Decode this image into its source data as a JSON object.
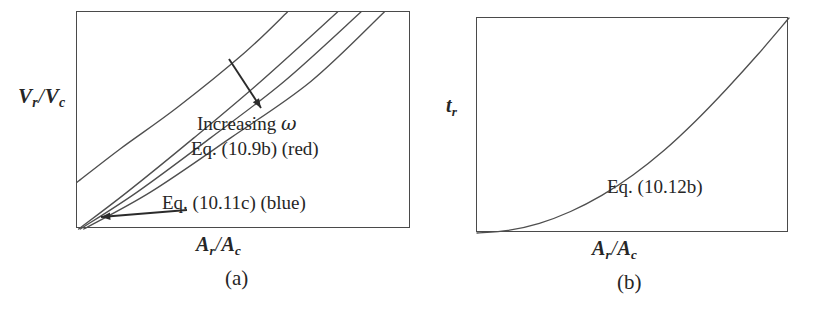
{
  "figure": {
    "background_color": "#ffffff",
    "ink_color": "#2b2b2b",
    "frame_color": "#4a4a4a",
    "curve_color": "#4f4f4f"
  },
  "panel_a": {
    "caption": "(a)",
    "ylabel": {
      "symbol": "V",
      "sub1": "r",
      "slash": "/",
      "symbol2": "V",
      "sub2": "c"
    },
    "xlabel": {
      "symbol": "A",
      "sub1": "r",
      "slash": "/",
      "symbol2": "A",
      "sub2": "c"
    },
    "annotations": {
      "increasing": "Increasing",
      "omega": "ω",
      "eq_red": "Eq. (10.9b)  (red)",
      "eq_blue": "Eq. (10.11c)  (blue)"
    },
    "arrows": {
      "increasing_arrow": "down-right-arrow",
      "blue_arrow": "left-arrow"
    }
  },
  "panel_b": {
    "caption": "(b)",
    "ylabel": {
      "symbol": "t",
      "sub1": "r"
    },
    "xlabel": {
      "symbol": "A",
      "sub1": "r",
      "slash": "/",
      "symbol2": "A",
      "sub2": "c"
    },
    "annotations": {
      "eq_curve": "Eq. (10.12b)"
    }
  },
  "chart_data": [
    {
      "id": "panel-a",
      "type": "line",
      "title": "(a)",
      "xlabel": "A_r/A_c",
      "ylabel": "V_r/V_c",
      "xlim": [
        0,
        1
      ],
      "ylim": [
        0,
        1
      ],
      "grid": false,
      "ticks": false,
      "legend": "in-plot text annotations",
      "annotations": [
        "Increasing ω",
        "Eq. (10.9b)  (red)",
        "Eq. (10.11c)  (blue)"
      ],
      "series": [
        {
          "name": "Eq. (10.11c) (blue)",
          "comment": "leftmost / steepest-looking line, exits left edge",
          "x": [
            0.0,
            0.13,
            0.3,
            0.5,
            0.63
          ],
          "y": [
            0.215,
            0.37,
            0.56,
            0.81,
            1.0
          ]
        },
        {
          "name": "Eq. (10.9b) (red) - low omega",
          "x": [
            0.005,
            0.15,
            0.35,
            0.55,
            0.78
          ],
          "y": [
            0.0,
            0.17,
            0.42,
            0.68,
            1.0
          ]
        },
        {
          "name": "Eq. (10.9b) (red) - mid omega",
          "x": [
            0.01,
            0.18,
            0.4,
            0.62,
            0.85
          ],
          "y": [
            0.0,
            0.17,
            0.42,
            0.68,
            1.0
          ]
        },
        {
          "name": "Eq. (10.9b) (red) - high omega",
          "x": [
            0.02,
            0.22,
            0.46,
            0.7,
            0.92
          ],
          "y": [
            0.0,
            0.17,
            0.42,
            0.68,
            1.0
          ]
        }
      ]
    },
    {
      "id": "panel-b",
      "type": "line",
      "title": "(b)",
      "xlabel": "A_r/A_c",
      "ylabel": "t_r",
      "xlim": [
        0,
        1
      ],
      "ylim": [
        0,
        1
      ],
      "grid": false,
      "ticks": false,
      "annotations": [
        "Eq. (10.12b)"
      ],
      "series": [
        {
          "name": "Eq. (10.12b)",
          "comment": "monotonically increasing convex curve",
          "x": [
            0.0,
            0.1,
            0.2,
            0.3,
            0.4,
            0.5,
            0.6,
            0.7,
            0.8,
            0.9,
            1.0
          ],
          "y": [
            0.0,
            0.012,
            0.045,
            0.1,
            0.175,
            0.27,
            0.385,
            0.52,
            0.67,
            0.83,
            1.0
          ]
        }
      ]
    }
  ]
}
